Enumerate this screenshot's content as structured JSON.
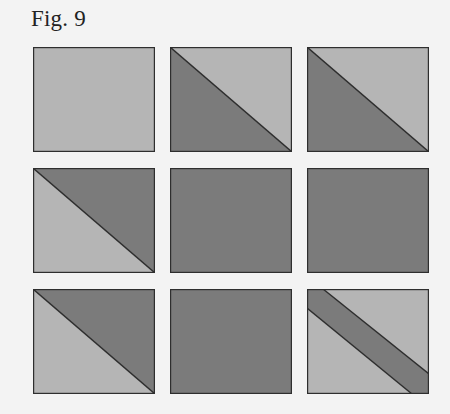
{
  "figure": {
    "title": "Fig. 9",
    "colors": {
      "background": "#f3f3f3",
      "light": "#b5b5b5",
      "dark": "#7b7b7b",
      "stroke": "#2e2e2e"
    },
    "tiles": [
      {
        "row": 1,
        "col": 1,
        "pattern": "solid-light"
      },
      {
        "row": 1,
        "col": 2,
        "pattern": "diagonal-dark-lower-left"
      },
      {
        "row": 1,
        "col": 3,
        "pattern": "diagonal-dark-lower-left"
      },
      {
        "row": 2,
        "col": 1,
        "pattern": "diagonal-dark-upper-right"
      },
      {
        "row": 2,
        "col": 2,
        "pattern": "solid-dark"
      },
      {
        "row": 2,
        "col": 3,
        "pattern": "solid-dark"
      },
      {
        "row": 3,
        "col": 1,
        "pattern": "diagonal-dark-upper-right"
      },
      {
        "row": 3,
        "col": 2,
        "pattern": "solid-dark"
      },
      {
        "row": 3,
        "col": 3,
        "pattern": "diagonal-dark-band"
      }
    ]
  }
}
